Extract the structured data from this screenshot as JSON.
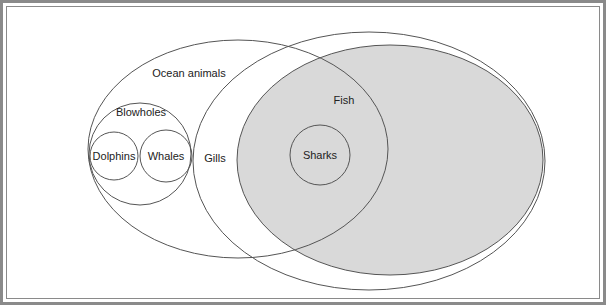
{
  "diagram": {
    "type": "euler-diagram",
    "colors": {
      "stroke": "#555555",
      "fish_fill": "#d9d9d9",
      "background": "#ffffff",
      "frame": "#8a8a8a"
    },
    "sets": [
      {
        "id": "ocean-animals",
        "label": "Ocean animals",
        "shape": "ellipse",
        "cx": 238,
        "cy": 149,
        "rx": 150,
        "ry": 109,
        "filled": false
      },
      {
        "id": "gills",
        "label": "Gills",
        "shape": "ellipse",
        "cx": 369,
        "cy": 161,
        "rx": 176,
        "ry": 129,
        "filled": false
      },
      {
        "id": "fish",
        "label": "Fish",
        "shape": "ellipse",
        "cx": 390,
        "cy": 160,
        "rx": 153,
        "ry": 115,
        "filled": true
      },
      {
        "id": "blowholes",
        "label": "Blowholes",
        "shape": "circle",
        "cx": 140,
        "cy": 154,
        "r": 51,
        "filled": false
      },
      {
        "id": "dolphins",
        "label": "Dolphins",
        "shape": "circle",
        "cx": 114,
        "cy": 156,
        "r": 24,
        "filled": false
      },
      {
        "id": "whales",
        "label": "Whales",
        "shape": "circle",
        "cx": 166,
        "cy": 156,
        "r": 26,
        "filled": false
      },
      {
        "id": "sharks",
        "label": "Sharks",
        "shape": "circle",
        "cx": 320,
        "cy": 155,
        "r": 30,
        "filled": false
      }
    ],
    "labels": {
      "ocean_animals": "Ocean animals",
      "gills": "Gills",
      "fish": "Fish",
      "blowholes": "Blowholes",
      "dolphins": "Dolphins",
      "whales": "Whales",
      "sharks": "Sharks"
    }
  }
}
